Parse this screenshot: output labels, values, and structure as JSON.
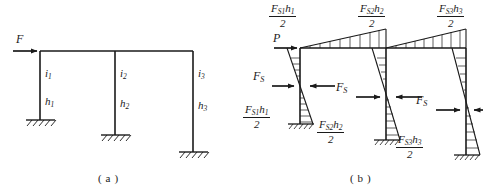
{
  "figure": {
    "panels": [
      {
        "id": "a",
        "caption": "( a )"
      },
      {
        "id": "b",
        "caption": "( b )"
      }
    ]
  },
  "panel_a": {
    "caption": "( a )",
    "load_label": "F",
    "columns": [
      {
        "stiffness_label": "i",
        "stiffness_sub": "1",
        "height_label": "h",
        "height_sub": "1"
      },
      {
        "stiffness_label": "i",
        "stiffness_sub": "2",
        "height_label": "h",
        "height_sub": "2"
      },
      {
        "stiffness_label": "i",
        "stiffness_sub": "3",
        "height_label": "h",
        "height_sub": "3"
      }
    ],
    "support_type": "fixed-hatched"
  },
  "panel_b": {
    "caption": "( b )",
    "load_label": "P",
    "shear_label": "F",
    "shear_sub": "S",
    "moments": [
      {
        "position": "top-1",
        "numerator_main": "F",
        "numerator_sub": "S1",
        "numerator_tail": "h",
        "numerator_tail_sub": "1",
        "denominator": "2"
      },
      {
        "position": "top-2",
        "numerator_main": "F",
        "numerator_sub": "S2",
        "numerator_tail": "h",
        "numerator_tail_sub": "2",
        "denominator": "2"
      },
      {
        "position": "top-3",
        "numerator_main": "F",
        "numerator_sub": "S3",
        "numerator_tail": "h",
        "numerator_tail_sub": "3",
        "denominator": "2"
      },
      {
        "position": "bottom-1",
        "numerator_main": "F",
        "numerator_sub": "S1",
        "numerator_tail": "h",
        "numerator_tail_sub": "1",
        "denominator": "2"
      },
      {
        "position": "bottom-2",
        "numerator_main": "F",
        "numerator_sub": "S2",
        "numerator_tail": "h",
        "numerator_tail_sub": "2",
        "denominator": "2"
      },
      {
        "position": "bottom-3",
        "numerator_main": "F",
        "numerator_sub": "S3",
        "numerator_tail": "h",
        "numerator_tail_sub": "3",
        "denominator": "2"
      }
    ],
    "shear_labels": [
      {
        "main": "F",
        "sub": "S"
      },
      {
        "main": "F",
        "sub": "S"
      },
      {
        "main": "F",
        "sub": "S"
      }
    ]
  },
  "colors": {
    "line": "#1a1a1a",
    "hatch": "#3a3a3a",
    "background": "#ffffff"
  }
}
